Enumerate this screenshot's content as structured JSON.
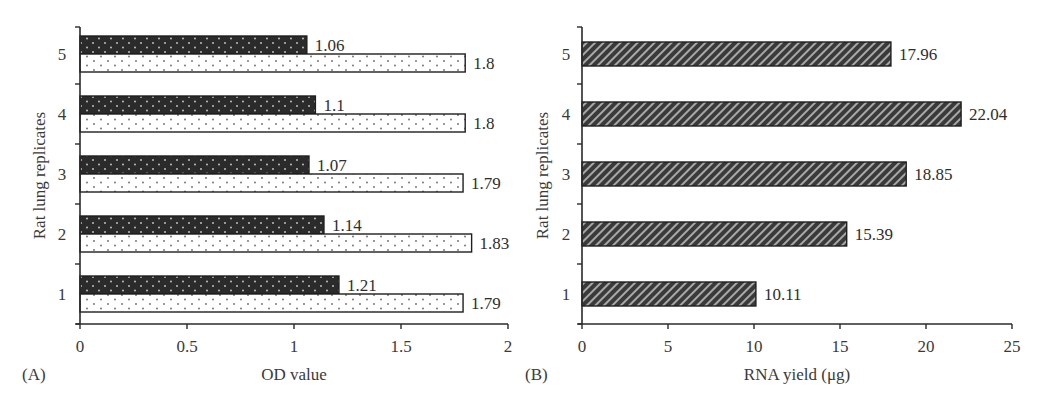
{
  "chart_data": [
    {
      "panel": "(A)",
      "type": "bar",
      "orientation": "horizontal",
      "title": "",
      "xlabel": "OD value",
      "ylabel": "Rat lung replicates",
      "xlim": [
        0,
        2
      ],
      "xticks": [
        "0",
        "0.5",
        "1",
        "1.5",
        "2"
      ],
      "categories": [
        "1",
        "2",
        "3",
        "4",
        "5"
      ],
      "series": [
        {
          "name": "series-dark",
          "pattern": "dark-dotted",
          "values": [
            1.21,
            1.14,
            1.07,
            1.1,
            1.06
          ],
          "labels": [
            "1.21",
            "1.14",
            "1.07",
            "1.1",
            "1.06"
          ]
        },
        {
          "name": "series-light",
          "pattern": "light-dotted",
          "values": [
            1.79,
            1.83,
            1.79,
            1.8,
            1.8
          ],
          "labels": [
            "1.79",
            "1.83",
            "1.79",
            "1.8",
            "1.8"
          ]
        }
      ],
      "grid": false,
      "legend": "none"
    },
    {
      "panel": "(B)",
      "type": "bar",
      "orientation": "horizontal",
      "title": "",
      "xlabel": "RNA yield (μg)",
      "ylabel": "Rat lung replicates",
      "xlim": [
        0,
        25
      ],
      "xticks": [
        "0",
        "5",
        "10",
        "15",
        "20",
        "25"
      ],
      "categories": [
        "1",
        "2",
        "3",
        "4",
        "5"
      ],
      "series": [
        {
          "name": "RNA yield",
          "pattern": "diagonal-hatch",
          "values": [
            10.11,
            15.39,
            18.85,
            22.04,
            17.96
          ],
          "labels": [
            "10.11",
            "15.39",
            "18.85",
            "22.04",
            "17.96"
          ]
        }
      ],
      "grid": false,
      "legend": "none"
    }
  ],
  "colors": {
    "axis": "#2a2a2a",
    "dark_bar": "#2b2b2b",
    "light_bar": "#ffffff",
    "hatch_bar": "#3c3c3c",
    "text": "#3a3a3a"
  }
}
